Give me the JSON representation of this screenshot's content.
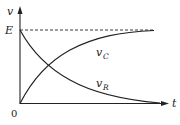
{
  "diagram": {
    "title": "",
    "axes": {
      "y_label": "v",
      "x_label": "t",
      "origin_label": "0"
    },
    "asymptote": {
      "label": "E",
      "style": "dashed"
    },
    "curves": [
      {
        "name": "v_C",
        "label_main": "v",
        "label_sub": "C",
        "shape": "rising exponential to E"
      },
      {
        "name": "v_R",
        "label_main": "v",
        "label_sub": "R",
        "shape": "decaying exponential from E to 0"
      }
    ],
    "colors": {
      "stroke": "#222222",
      "background": "#ffffff"
    }
  }
}
